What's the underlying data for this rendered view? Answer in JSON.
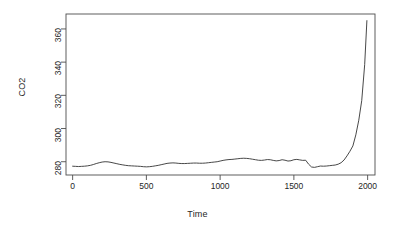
{
  "figure": {
    "background": "#ffffff",
    "foreground": "#262626",
    "line_color": "#333333"
  },
  "axes": {
    "xlabel": "Time",
    "ylabel": "CO2",
    "xticks": [
      0,
      500,
      1000,
      1500,
      2000
    ],
    "xtick_labels": [
      "0",
      "500",
      "1000",
      "1500",
      "2000"
    ],
    "yticks": [
      280,
      300,
      320,
      340,
      360
    ],
    "ytick_labels": [
      "280",
      "300",
      "320",
      "340",
      "360"
    ]
  },
  "chart_data": {
    "type": "line",
    "title": "",
    "xlabel": "Time",
    "ylabel": "CO2",
    "xlim": [
      -45,
      2050
    ],
    "ylim": [
      272,
      369
    ],
    "grid": false,
    "legend": "none",
    "xticks": [
      0,
      500,
      1000,
      1500,
      2000
    ],
    "yticks": [
      280,
      300,
      320,
      340,
      360
    ],
    "series": [
      {
        "name": "CO2",
        "x": [
          0,
          20,
          40,
          60,
          80,
          100,
          120,
          140,
          160,
          180,
          200,
          220,
          240,
          260,
          280,
          300,
          320,
          340,
          360,
          380,
          400,
          420,
          440,
          460,
          480,
          500,
          520,
          540,
          560,
          580,
          600,
          620,
          640,
          660,
          680,
          700,
          720,
          740,
          760,
          780,
          800,
          820,
          840,
          860,
          880,
          900,
          920,
          940,
          960,
          980,
          1000,
          1020,
          1040,
          1060,
          1080,
          1100,
          1120,
          1140,
          1160,
          1180,
          1200,
          1220,
          1240,
          1260,
          1280,
          1300,
          1320,
          1340,
          1360,
          1380,
          1400,
          1420,
          1440,
          1460,
          1480,
          1500,
          1520,
          1540,
          1560,
          1580,
          1600,
          1620,
          1640,
          1660,
          1680,
          1700,
          1720,
          1740,
          1760,
          1780,
          1800,
          1820,
          1840,
          1860,
          1880,
          1900,
          1920,
          1940,
          1960,
          1980,
          1995
        ],
        "y": [
          277.3,
          277.2,
          277.1,
          277.2,
          277.3,
          277.5,
          277.8,
          278.3,
          278.9,
          279.4,
          279.8,
          280.0,
          279.9,
          279.6,
          279.2,
          278.8,
          278.4,
          278.1,
          277.8,
          277.6,
          277.5,
          277.4,
          277.3,
          277.2,
          277.0,
          276.9,
          277.0,
          277.2,
          277.5,
          277.8,
          278.2,
          278.6,
          279.0,
          279.2,
          279.3,
          279.2,
          279.0,
          278.9,
          278.9,
          279.0,
          279.1,
          279.2,
          279.2,
          279.1,
          279.1,
          279.2,
          279.4,
          279.6,
          279.8,
          280.0,
          280.4,
          280.8,
          281.1,
          281.3,
          281.4,
          281.6,
          281.8,
          282.0,
          282.1,
          282.0,
          281.8,
          281.5,
          281.2,
          280.9,
          280.8,
          281.0,
          281.3,
          281.2,
          280.8,
          280.5,
          280.7,
          281.2,
          280.9,
          280.4,
          280.6,
          281.2,
          281.4,
          281.1,
          280.8,
          280.9,
          278.5,
          276.8,
          276.6,
          277.0,
          277.4,
          277.3,
          277.4,
          277.6,
          277.8,
          278.0,
          278.5,
          279.4,
          281.0,
          283.5,
          286.3,
          289.5,
          296.2,
          305.0,
          316.8,
          338.5,
          365.0
        ]
      }
    ],
    "annotations": [
      {
        "text": "flat pre-industrial baseline near 277-282 ppm",
        "x_range": [
          0,
          1550
        ]
      },
      {
        "text": "dip near year 1600 to about 276.6 ppm",
        "x_range": [
          1560,
          1650
        ]
      },
      {
        "text": "sharp industrial-era rise to about 365 ppm",
        "x_range": [
          1800,
          1995
        ]
      }
    ]
  }
}
